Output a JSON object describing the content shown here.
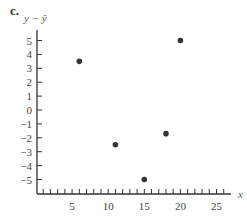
{
  "panel_label": "c.",
  "chart_data": {
    "type": "scatter",
    "title": "",
    "xlabel": "x",
    "ylabel": "y − ŷ",
    "xlim": [
      0,
      27
    ],
    "ylim": [
      -6,
      6
    ],
    "x_ticks": [
      5,
      10,
      15,
      20,
      25
    ],
    "x_minor_tick_step": 1,
    "y_ticks": [
      5,
      4,
      3,
      2,
      1,
      0,
      -1,
      -2,
      -3,
      -4,
      -5
    ],
    "grid": false,
    "legend": null,
    "series": [
      {
        "name": "residuals",
        "color": "#333333",
        "points": [
          {
            "x": 6,
            "y": 3.5
          },
          {
            "x": 11,
            "y": -2.5
          },
          {
            "x": 15,
            "y": -5
          },
          {
            "x": 18,
            "y": -1.7
          },
          {
            "x": 20,
            "y": 5
          }
        ]
      }
    ]
  }
}
